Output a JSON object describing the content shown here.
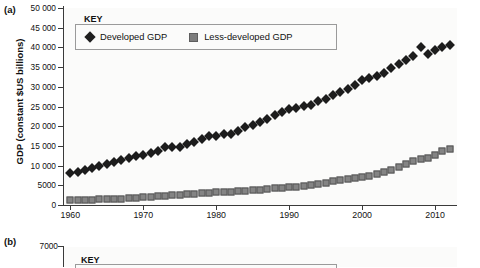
{
  "figure": {
    "panel_a_letter": "(a)",
    "panel_b_letter": "(b)"
  },
  "chart_data": [
    {
      "type": "scatter",
      "panel": "(a)",
      "title": "",
      "xlabel": "",
      "ylabel": "GDP (constant $US billions)",
      "xlim": [
        1959,
        2013
      ],
      "ylim": [
        0,
        50000
      ],
      "grid": false,
      "legend_title": "KEY",
      "legend_position": "top-left-inside",
      "xticks": [
        1960,
        1970,
        1980,
        1990,
        2000,
        2010
      ],
      "xtick_labels": [
        "1960",
        "1970",
        "1980",
        "1990",
        "2000",
        "2010"
      ],
      "yticks": [
        0,
        5000,
        10000,
        15000,
        20000,
        25000,
        30000,
        35000,
        40000,
        45000,
        50000
      ],
      "ytick_labels": [
        "0",
        "5000",
        "10 000",
        "15 000",
        "20 000",
        "25 000",
        "30 000",
        "35 000",
        "40 000",
        "45 000",
        "50 000"
      ],
      "x": [
        1960,
        1961,
        1962,
        1963,
        1964,
        1965,
        1966,
        1967,
        1968,
        1969,
        1970,
        1971,
        1972,
        1973,
        1974,
        1975,
        1976,
        1977,
        1978,
        1979,
        1980,
        1981,
        1982,
        1983,
        1984,
        1985,
        1986,
        1987,
        1988,
        1989,
        1990,
        1991,
        1992,
        1993,
        1994,
        1995,
        1996,
        1997,
        1998,
        1999,
        2000,
        2001,
        2002,
        2003,
        2004,
        2005,
        2006,
        2007,
        2008,
        2009,
        2010,
        2011,
        2012
      ],
      "series": [
        {
          "name": "Developed GDP",
          "marker": "diamond",
          "color": "#1c1c1c",
          "values": [
            8100,
            8450,
            8950,
            9350,
            9900,
            10450,
            11000,
            11300,
            11850,
            12400,
            12700,
            13100,
            13800,
            14600,
            14700,
            14600,
            15400,
            16000,
            16700,
            17400,
            17600,
            18000,
            18100,
            18750,
            19700,
            20400,
            21000,
            21800,
            22800,
            23700,
            24400,
            24600,
            25100,
            25500,
            26300,
            27000,
            27800,
            28700,
            29400,
            30500,
            31800,
            32200,
            32800,
            33600,
            34700,
            35700,
            36800,
            37700,
            40000,
            38200,
            39300,
            40000,
            40500
          ]
        },
        {
          "name": "Less-developed GDP",
          "marker": "square",
          "color": "#848484",
          "values": [
            1200,
            1230,
            1280,
            1330,
            1420,
            1490,
            1570,
            1630,
            1730,
            1850,
            1950,
            2050,
            2180,
            2350,
            2450,
            2520,
            2680,
            2800,
            2950,
            3100,
            3220,
            3300,
            3350,
            3450,
            3600,
            3720,
            3850,
            4020,
            4200,
            4350,
            4500,
            4650,
            4850,
            5100,
            5400,
            5700,
            6050,
            6400,
            6550,
            6800,
            7200,
            7450,
            7800,
            8250,
            8900,
            9600,
            10400,
            11200,
            11700,
            11900,
            12800,
            13600,
            14200
          ]
        }
      ]
    },
    {
      "type": "scatter",
      "panel": "(b)",
      "title": "",
      "ylabel": "",
      "ylim": [
        0,
        7000
      ],
      "yticks": [
        7000
      ],
      "ytick_labels": [
        "7000"
      ],
      "legend_title": "KEY",
      "series": []
    }
  ]
}
